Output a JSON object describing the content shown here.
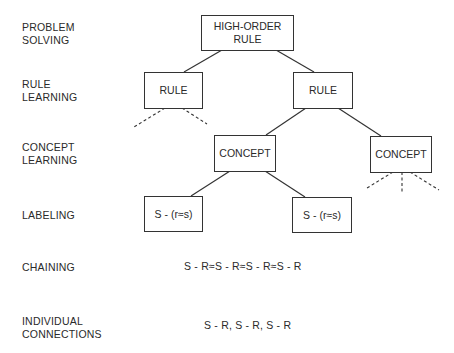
{
  "levels": [
    {
      "id": "problem-solving",
      "label": "PROBLEM\nSOLVING"
    },
    {
      "id": "rule-learning",
      "label": "RULE\nLEARNING"
    },
    {
      "id": "concept-learning",
      "label": "CONCEPT\nLEARNING"
    },
    {
      "id": "labeling",
      "label": "LABELING"
    },
    {
      "id": "chaining",
      "label": "CHAINING"
    },
    {
      "id": "individual-connections",
      "label": "INDIVIDUAL\nCONNECTIONS"
    }
  ],
  "nodes": {
    "high_order_rule": "HIGH-ORDER\nRULE",
    "rule_left": "RULE",
    "rule_right": "RULE",
    "concept_left": "CONCEPT",
    "concept_right": "CONCEPT",
    "label_left": "S - (r≈s)",
    "label_right": "S - (r≈s)"
  },
  "chaining_text": "S - R≈S - R≈S - R≈S - R",
  "connections_text": "S - R, S - R, S - R"
}
